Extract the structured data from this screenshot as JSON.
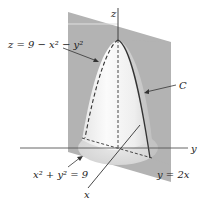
{
  "figure": {
    "labels": {
      "z_axis": "z",
      "y_axis": "y",
      "x_axis": "x",
      "surface": "z = 9 − x² − y²",
      "curve": "C",
      "cylinder": "x² + y² = 9",
      "plane": "y = 2x"
    },
    "colors": {
      "background": "#ffffff",
      "plane": "#b3b3b3",
      "plane_dark": "#a6a6a6",
      "paraboloid_light": "#f4f4f4",
      "paraboloid_shade": "#d8d8d8",
      "base_ellipse": "#dedede",
      "axes": "#333333",
      "curve": "#333333"
    }
  }
}
